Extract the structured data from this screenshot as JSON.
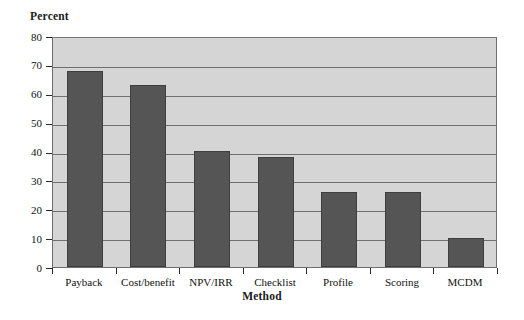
{
  "chart_data": {
    "type": "bar",
    "title": "",
    "subtitle": "",
    "xlabel": "Method",
    "ylabel": "Percent",
    "categories": [
      "Payback",
      "Cost/benefit",
      "NPV/IRR",
      "Checklist",
      "Profile",
      "Scoring",
      "MCDM"
    ],
    "values": [
      68,
      63,
      40,
      38,
      26,
      26,
      10
    ],
    "series": [
      {
        "name": "Percent",
        "values": [
          68,
          63,
          40,
          38,
          26,
          26,
          10
        ]
      }
    ],
    "ylim": [
      0,
      80
    ],
    "ytick_step": 10,
    "yticks": [
      "80",
      "70",
      "60",
      "50",
      "40",
      "30",
      "20",
      "10",
      "0"
    ],
    "ytick_values": [
      80,
      70,
      60,
      50,
      40,
      30,
      20,
      10,
      0
    ],
    "xlim_categories": 7,
    "grid": "horizontal",
    "legend": "none",
    "legend_position": "none",
    "annotations": [],
    "colors": {
      "bar_fill": "#555556",
      "bar_edge": "#3e3e3f",
      "plot_background": "#d5d5d5",
      "gridline": "#6f6f6f",
      "axis": "#2a2a2a",
      "text": "#111111",
      "figure_background": "#ffffff"
    }
  },
  "axes": {
    "y_title": "Percent",
    "x_title": "Method"
  }
}
